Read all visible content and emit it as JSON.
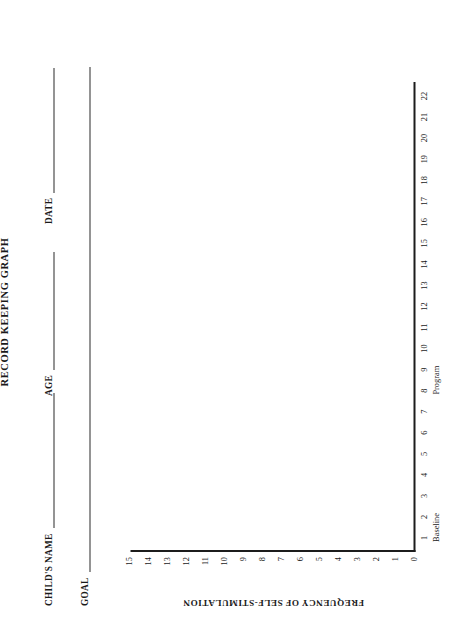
{
  "document": {
    "title": "RECORD KEEPING GRAPH"
  },
  "form_fields": [
    {
      "label": "CHILD'S NAME",
      "value": ""
    },
    {
      "label": "AGE",
      "value": ""
    },
    {
      "label": "DATE",
      "value": ""
    },
    {
      "label": "GOAL",
      "value": ""
    }
  ],
  "chart_data": {
    "type": "line",
    "title": "RECORD KEEPING GRAPH",
    "xlabel": "",
    "ylabel": "FREQUENCY OF SELF-STIMULATION",
    "ylim": [
      0,
      15
    ],
    "xlim": [
      1,
      22
    ],
    "grid": false,
    "legend": null,
    "y_ticks": [
      0,
      1,
      2,
      3,
      4,
      5,
      6,
      7,
      8,
      9,
      10,
      11,
      12,
      13,
      14,
      15
    ],
    "x_ticks": [
      1,
      2,
      3,
      4,
      5,
      6,
      7,
      8,
      9,
      10,
      11,
      12,
      13,
      14,
      15,
      16,
      17,
      18,
      19,
      20,
      21,
      22
    ],
    "x": [],
    "values": [],
    "series": [],
    "annotations": [
      {
        "text": "Baseline",
        "x": 1.5
      },
      {
        "text": "Program",
        "x": 8.5
      }
    ]
  },
  "colors": {
    "ink": "#1c1c1c",
    "paper": "#ffffff"
  }
}
